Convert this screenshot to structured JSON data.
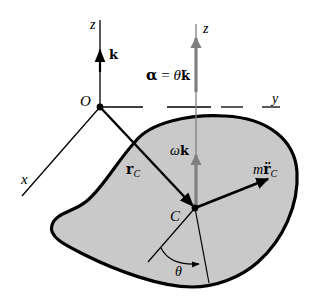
{
  "diagram": {
    "colors": {
      "body_fill": "#c9c9c9",
      "outline": "#000000",
      "gray_axis": "#7f7f7f",
      "background": "#ffffff"
    },
    "labels": {
      "z_left": "z",
      "k_unit": "k",
      "origin": "O",
      "z_right": "z",
      "alpha_bold": "α",
      "alpha_eq": " = ",
      "theta_ddot": "θ̈",
      "alpha_k": "k",
      "y_axis": "y",
      "x_axis": "x",
      "r_vec": "r",
      "r_sub": "C",
      "omega": "ω",
      "omega_k": "k",
      "m": "m",
      "r_ddot": "r̈",
      "mr_sub": "C",
      "center": "C",
      "theta": "θ"
    },
    "elements": [
      {
        "name": "z-axis-fixed",
        "from": [
          100,
          20
        ],
        "to": [
          100,
          107
        ]
      },
      {
        "name": "unit-vector-k",
        "from": [
          100,
          72
        ],
        "to": [
          100,
          52
        ]
      },
      {
        "name": "y-axis-dashed",
        "from": [
          100,
          107
        ],
        "to": [
          280,
          107
        ]
      },
      {
        "name": "x-axis",
        "from": [
          100,
          107
        ],
        "to": [
          22,
          196
        ]
      },
      {
        "name": "position-vector-rC",
        "from": [
          100,
          107
        ],
        "to": [
          195,
          208
        ]
      },
      {
        "name": "z-axis-through-C",
        "from": [
          196,
          25
        ],
        "to": [
          196,
          208
        ]
      },
      {
        "name": "inertial-force-m-rddot-C",
        "from": [
          195,
          208
        ],
        "to": [
          268,
          178
        ]
      },
      {
        "name": "center-of-mass-C",
        "at": [
          195,
          208
        ]
      },
      {
        "name": "theta-arc",
        "from": "reference line",
        "to": "radial line"
      }
    ]
  }
}
